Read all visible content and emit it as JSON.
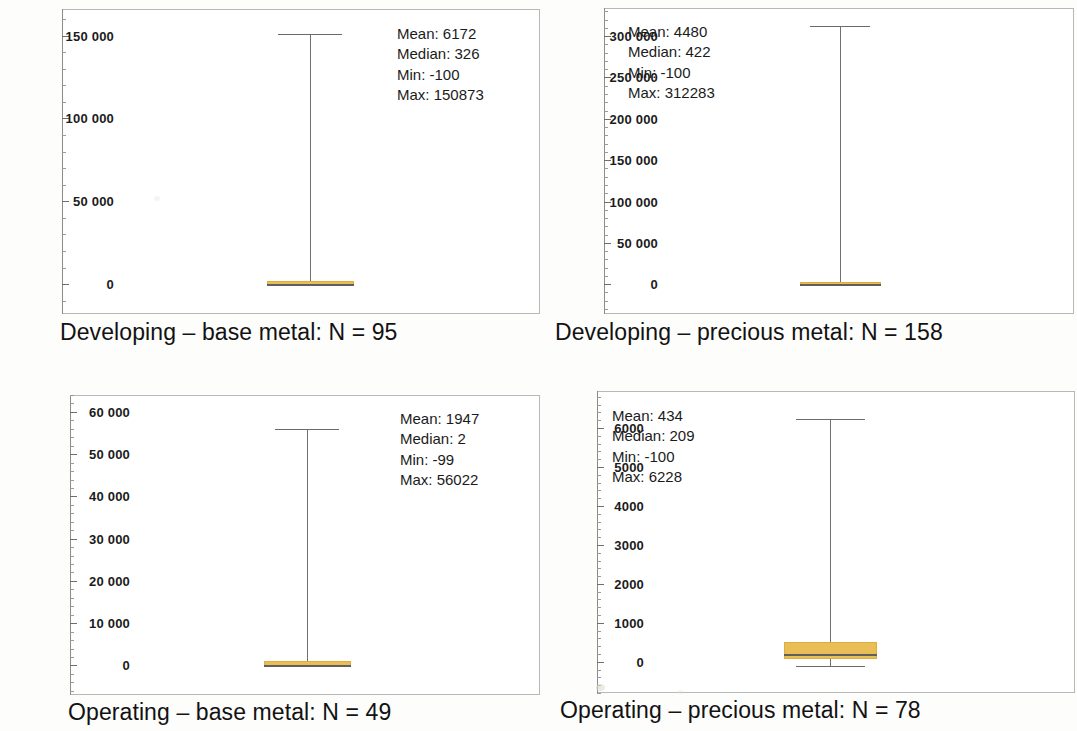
{
  "figure": {
    "background_color": "#fdfdfc",
    "box_color": "#e9be57",
    "line_color": "#707070"
  },
  "chart_data": [
    {
      "type": "box",
      "panel_id": "developing-base-metal",
      "title": "Developing – base metal: N = 95",
      "group_label": "Developing – base metal",
      "n": 95,
      "stats": {
        "mean_label": "Mean: 6172",
        "median_label": "Median: 326",
        "min_label": "Min: -100",
        "max_label": "Max: 150873",
        "mean": 6172,
        "median": 326,
        "min": -100,
        "max": 150873
      },
      "stats_position": "top-right",
      "ylim": [
        -18000,
        166000
      ],
      "ytick_values": [
        0,
        50000,
        100000,
        150000
      ],
      "ytick_labels": [
        "0",
        "50 000",
        "100 000",
        "150 000"
      ],
      "yminor_step": 10000,
      "ylabel": "",
      "xlabel": "",
      "grid": false,
      "box": {
        "q1": -100,
        "q3": 2200,
        "median": 326,
        "whisker_low": -100,
        "whisker_high": 150873
      }
    },
    {
      "type": "box",
      "panel_id": "developing-precious-metal",
      "title": "Developing – precious metal: N = 158",
      "group_label": "Developing – precious metal",
      "n": 158,
      "stats": {
        "mean_label": "Mean: 4480",
        "median_label": "Median: 422",
        "min_label": "Min: -100",
        "max_label": "Max: 312283",
        "mean": 4480,
        "median": 422,
        "min": -100,
        "max": 312283
      },
      "stats_position": "top-left",
      "ylim": [
        -36000,
        334000
      ],
      "ytick_values": [
        0,
        50000,
        100000,
        150000,
        200000,
        250000,
        300000
      ],
      "ytick_labels": [
        "0",
        "50 000",
        "100 000",
        "150 000",
        "200 000",
        "250 000",
        "300 000"
      ],
      "yminor_step": 10000,
      "ylabel": "",
      "xlabel": "",
      "grid": false,
      "box": {
        "q1": -100,
        "q3": 2600,
        "median": 422,
        "whisker_low": -100,
        "whisker_high": 312283
      }
    },
    {
      "type": "box",
      "panel_id": "operating-base-metal",
      "title": "Operating – base metal: N = 49",
      "group_label": "Operating – base metal",
      "n": 49,
      "stats": {
        "mean_label": "Mean: 1947",
        "median_label": "Median: 2",
        "min_label": "Min: -99",
        "max_label": "Max: 56022",
        "mean": 1947,
        "median": 2,
        "min": -99,
        "max": 56022
      },
      "stats_position": "top-right",
      "ylim": [
        -7000,
        64000
      ],
      "ytick_values": [
        0,
        10000,
        20000,
        30000,
        40000,
        50000,
        60000
      ],
      "ytick_labels": [
        "0",
        "10 000",
        "20 000",
        "30 000",
        "40 000",
        "50 000",
        "60 000"
      ],
      "yminor_step": 2000,
      "ylabel": "",
      "xlabel": "",
      "grid": false,
      "box": {
        "q1": -99,
        "q3": 1100,
        "median": 2,
        "whisker_low": -99,
        "whisker_high": 56022
      }
    },
    {
      "type": "box",
      "panel_id": "operating-precious-metal",
      "title": "Operating – precious metal: N = 78",
      "group_label": "Operating – precious metal",
      "n": 78,
      "stats": {
        "mean_label": "Mean: 434",
        "median_label": "Median: 209",
        "min_label": "Min: -100",
        "max_label": "Max: 6228",
        "mean": 434,
        "median": 209,
        "min": -100,
        "max": 6228
      },
      "stats_position": "top-left",
      "ylim": [
        -800,
        6950
      ],
      "ytick_values": [
        0,
        1000,
        2000,
        3000,
        4000,
        5000,
        6000
      ],
      "ytick_labels": [
        "0",
        "1000",
        "2000",
        "3000",
        "4000",
        "5000",
        "6000"
      ],
      "yminor_step": 200,
      "ylabel": "",
      "xlabel": "",
      "grid": false,
      "box": {
        "q1": 70,
        "q3": 520,
        "median": 209,
        "whisker_low": -100,
        "whisker_high": 6228
      }
    }
  ]
}
